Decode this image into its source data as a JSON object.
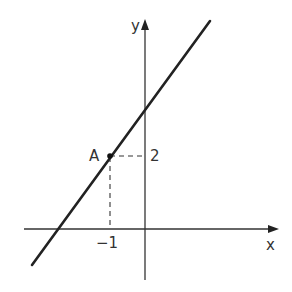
{
  "diagram": {
    "type": "coordinate-graph",
    "axes": {
      "x_label": "x",
      "y_label": "y"
    },
    "point": {
      "label": "A",
      "x": -1,
      "y": 2
    },
    "ticks": {
      "x_tick_label": "−1",
      "y_tick_label": "2"
    },
    "line": {
      "description": "straight line through A with positive gradient",
      "passes_through": [
        -1,
        2
      ]
    },
    "colors": {
      "ink": "#222222",
      "text": "#333333"
    }
  }
}
